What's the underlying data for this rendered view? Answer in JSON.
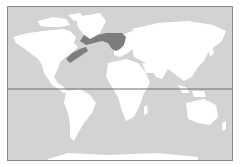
{
  "map": {
    "type": "world-distribution-map",
    "projection": "equirectangular-like",
    "colors": {
      "ocean": "#d3d3d3",
      "land": "#ffffff",
      "range": "#7d7d7d",
      "frame": "#8a8a8a",
      "equator": "#6e6e6e"
    },
    "reference_lines": [
      {
        "name": "equator"
      }
    ],
    "highlighted_range": {
      "description": "North Atlantic coastal distribution",
      "regions": [
        "eastern North America coast",
        "southern Greenland",
        "Iceland",
        "British Isles",
        "Scandinavia coast",
        "North Sea"
      ]
    }
  }
}
